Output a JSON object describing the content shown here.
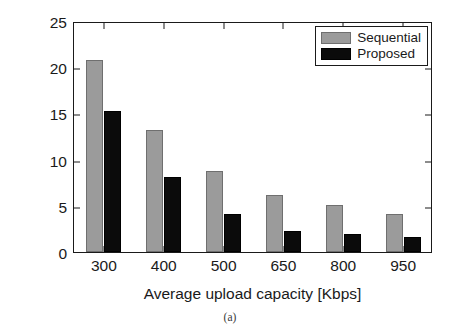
{
  "caption": "(a)",
  "legend": {
    "position": "top-right",
    "entries": [
      {
        "label": "Sequential",
        "color": "#9b9b9b",
        "swatch": "gray-swatch"
      },
      {
        "label": "Proposed",
        "color": "#0b0b0b",
        "swatch": "black-swatch"
      }
    ]
  },
  "chart_data": {
    "type": "bar",
    "title": "",
    "subtitle": "",
    "xlabel": "Average upload capacity [Kbps]",
    "ylabel": "Average seeking delay [s]",
    "categories": [
      "300",
      "400",
      "500",
      "650",
      "800",
      "950"
    ],
    "series": [
      {
        "name": "Sequential",
        "color": "#9b9b9b",
        "values": [
          20.8,
          13.2,
          8.8,
          6.2,
          5.1,
          4.1
        ]
      },
      {
        "name": "Proposed",
        "color": "#0b0b0b",
        "values": [
          15.3,
          8.1,
          4.1,
          2.3,
          2.0,
          1.6
        ]
      }
    ],
    "ylim": [
      0,
      25
    ],
    "yticks": [
      0,
      5,
      10,
      15,
      20,
      25
    ],
    "ytick_labels": [
      "0",
      "5",
      "10",
      "15",
      "20",
      "25"
    ],
    "xtick_labels": [
      "300",
      "400",
      "500",
      "650",
      "800",
      "950"
    ],
    "grid": false,
    "legend_position": "top-right",
    "annotations": [
      "(a)"
    ]
  }
}
